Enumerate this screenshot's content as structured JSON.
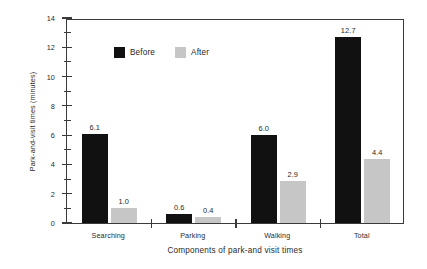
{
  "chart_data": {
    "type": "bar",
    "title": "",
    "xlabel": "Components of park-and visit times",
    "ylabel": "Park-and-visit times (minutes)",
    "categories": [
      "Searching",
      "Parking",
      "Walking",
      "Total"
    ],
    "series": [
      {
        "name": "Before",
        "color": "#111111",
        "values": [
          6.1,
          0.6,
          6.0,
          12.7
        ],
        "labels": [
          "6.1",
          "0.6",
          "6.0",
          "12.7"
        ]
      },
      {
        "name": "After",
        "color": "#c6c6c6",
        "values": [
          1.0,
          0.4,
          2.9,
          4.4
        ],
        "labels": [
          "1.0",
          "0.4",
          "2.9",
          "4.4"
        ]
      }
    ],
    "ylim": [
      0,
      14
    ],
    "ytick_major": [
      0,
      2,
      4,
      6,
      8,
      10,
      12,
      14
    ],
    "ytick_major_labels": [
      "0",
      "2",
      "4",
      "6",
      "8",
      "10",
      "12",
      "14"
    ],
    "ytick_minor": [
      1,
      3,
      5,
      7,
      9,
      11,
      13
    ],
    "grid": false,
    "legend_position": "upper-left-inside",
    "value_labels_shown": true
  }
}
